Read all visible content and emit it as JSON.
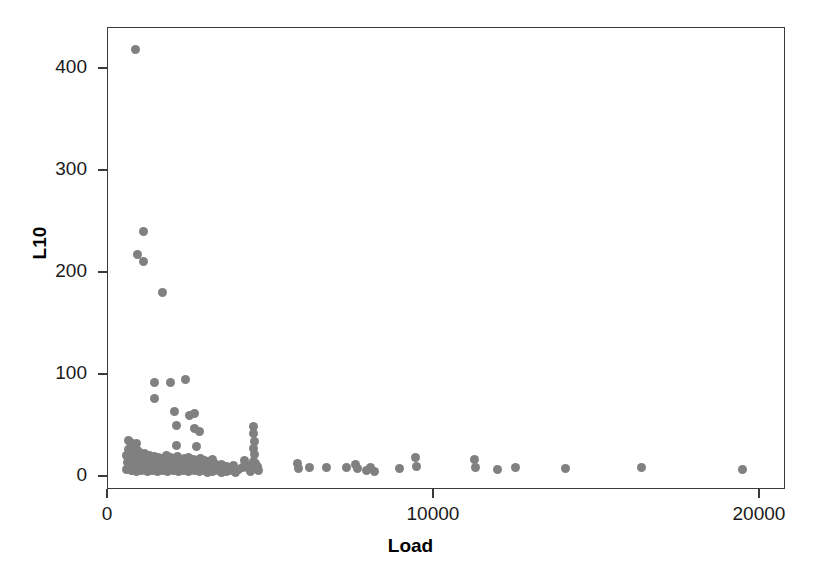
{
  "chart_data": {
    "type": "scatter",
    "title": "",
    "xlabel": "Load",
    "ylabel": "L10",
    "xlim": [
      0,
      20800
    ],
    "ylim": [
      -13,
      440
    ],
    "xticks": [
      0,
      10000,
      20000
    ],
    "xticklabels": [
      "0",
      "10000",
      "20000"
    ],
    "yticks": [
      0,
      100,
      200,
      300,
      400
    ],
    "yticklabels": [
      "0",
      "100",
      "200",
      "300",
      "400"
    ],
    "grid": false,
    "legend": null,
    "marker": {
      "shape": "circle",
      "color": "#808080",
      "size_px": 9
    },
    "frame_color": "#3a3a3a",
    "background": "#ffffff",
    "series": [
      {
        "name": "L10 vs Load",
        "color": "#808080",
        "points": [
          [
            850,
            419
          ],
          [
            1100,
            240
          ],
          [
            910,
            218
          ],
          [
            1100,
            211
          ],
          [
            1670,
            181
          ],
          [
            1430,
            92
          ],
          [
            1920,
            92
          ],
          [
            2370,
            95
          ],
          [
            1430,
            77
          ],
          [
            2030,
            64
          ],
          [
            2490,
            60
          ],
          [
            2640,
            62
          ],
          [
            2090,
            50
          ],
          [
            2640,
            47
          ],
          [
            2820,
            44
          ],
          [
            2090,
            31
          ],
          [
            2700,
            30
          ],
          [
            630,
            36
          ],
          [
            700,
            34
          ],
          [
            880,
            33
          ],
          [
            780,
            28
          ],
          [
            640,
            27
          ],
          [
            700,
            25
          ],
          [
            900,
            26
          ],
          [
            760,
            22
          ],
          [
            560,
            21
          ],
          [
            620,
            19
          ],
          [
            880,
            20
          ],
          [
            980,
            24
          ],
          [
            1040,
            22
          ],
          [
            1130,
            23
          ],
          [
            1210,
            19
          ],
          [
            1280,
            21
          ],
          [
            1350,
            18
          ],
          [
            1420,
            20
          ],
          [
            1490,
            17
          ],
          [
            1560,
            19
          ],
          [
            1630,
            16
          ],
          [
            1700,
            18
          ],
          [
            1780,
            21
          ],
          [
            1850,
            17
          ],
          [
            1920,
            19
          ],
          [
            1990,
            16
          ],
          [
            2060,
            18
          ],
          [
            2130,
            20
          ],
          [
            2200,
            17
          ],
          [
            2270,
            15
          ],
          [
            2340,
            18
          ],
          [
            2410,
            16
          ],
          [
            2480,
            19
          ],
          [
            2550,
            15
          ],
          [
            2620,
            17
          ],
          [
            2690,
            14
          ],
          [
            2760,
            16
          ],
          [
            2830,
            18
          ],
          [
            2900,
            14
          ],
          [
            2970,
            16
          ],
          [
            3050,
            13
          ],
          [
            3120,
            15
          ],
          [
            3200,
            17
          ],
          [
            3280,
            13
          ],
          [
            600,
            14
          ],
          [
            670,
            12
          ],
          [
            740,
            15
          ],
          [
            810,
            11
          ],
          [
            880,
            13
          ],
          [
            950,
            10
          ],
          [
            1020,
            14
          ],
          [
            1090,
            11
          ],
          [
            1160,
            13
          ],
          [
            1230,
            9
          ],
          [
            1300,
            12
          ],
          [
            1370,
            14
          ],
          [
            1440,
            10
          ],
          [
            1510,
            12
          ],
          [
            1580,
            9
          ],
          [
            1650,
            13
          ],
          [
            1720,
            11
          ],
          [
            1790,
            8
          ],
          [
            1860,
            12
          ],
          [
            1930,
            10
          ],
          [
            2000,
            13
          ],
          [
            2070,
            9
          ],
          [
            2140,
            11
          ],
          [
            2210,
            8
          ],
          [
            2280,
            12
          ],
          [
            2350,
            10
          ],
          [
            2420,
            7
          ],
          [
            2490,
            11
          ],
          [
            2560,
            9
          ],
          [
            2630,
            12
          ],
          [
            2700,
            8
          ],
          [
            2770,
            10
          ],
          [
            2840,
            7
          ],
          [
            2910,
            11
          ],
          [
            2980,
            9
          ],
          [
            3050,
            6
          ],
          [
            3120,
            10
          ],
          [
            3190,
            8
          ],
          [
            3260,
            11
          ],
          [
            3340,
            7
          ],
          [
            3410,
            9
          ],
          [
            3480,
            12
          ],
          [
            3550,
            8
          ],
          [
            3630,
            10
          ],
          [
            3700,
            6
          ],
          [
            3780,
            9
          ],
          [
            3860,
            11
          ],
          [
            580,
            7
          ],
          [
            650,
            9
          ],
          [
            720,
            6
          ],
          [
            800,
            8
          ],
          [
            880,
            5
          ],
          [
            960,
            8
          ],
          [
            1040,
            6
          ],
          [
            1120,
            9
          ],
          [
            1200,
            5
          ],
          [
            1280,
            7
          ],
          [
            1360,
            6
          ],
          [
            1440,
            8
          ],
          [
            1520,
            5
          ],
          [
            1600,
            7
          ],
          [
            1680,
            6
          ],
          [
            1760,
            9
          ],
          [
            1840,
            5
          ],
          [
            1920,
            7
          ],
          [
            2000,
            6
          ],
          [
            2080,
            8
          ],
          [
            2160,
            5
          ],
          [
            2240,
            7
          ],
          [
            2320,
            6
          ],
          [
            2400,
            9
          ],
          [
            2480,
            5
          ],
          [
            2560,
            7
          ],
          [
            2640,
            6
          ],
          [
            2720,
            8
          ],
          [
            2800,
            5
          ],
          [
            2880,
            7
          ],
          [
            2960,
            6
          ],
          [
            3040,
            4
          ],
          [
            3120,
            7
          ],
          [
            3200,
            5
          ],
          [
            3290,
            8
          ],
          [
            3380,
            6
          ],
          [
            3470,
            4
          ],
          [
            3560,
            7
          ],
          [
            3650,
            5
          ],
          [
            3740,
            8
          ],
          [
            3830,
            6
          ],
          [
            3920,
            4
          ],
          [
            4010,
            7
          ],
          [
            4120,
            9
          ],
          [
            4240,
            11
          ],
          [
            4380,
            8
          ],
          [
            4460,
            49
          ],
          [
            4470,
            42
          ],
          [
            4480,
            35
          ],
          [
            4460,
            28
          ],
          [
            4490,
            22
          ],
          [
            4470,
            15
          ],
          [
            4440,
            8
          ],
          [
            4360,
            5
          ],
          [
            4290,
            9
          ],
          [
            4180,
            16
          ],
          [
            4580,
            10
          ],
          [
            4610,
            6
          ],
          [
            4540,
            13
          ],
          [
            5800,
            13
          ],
          [
            5830,
            8
          ],
          [
            6190,
            9
          ],
          [
            6690,
            9
          ],
          [
            7320,
            9
          ],
          [
            7590,
            12
          ],
          [
            7660,
            8
          ],
          [
            7940,
            6
          ],
          [
            8060,
            9
          ],
          [
            8170,
            5
          ],
          [
            8950,
            8
          ],
          [
            9440,
            19
          ],
          [
            9450,
            10
          ],
          [
            11250,
            17
          ],
          [
            11280,
            9
          ],
          [
            11960,
            7
          ],
          [
            12510,
            9
          ],
          [
            14050,
            8
          ],
          [
            16380,
            9
          ],
          [
            19480,
            7
          ]
        ]
      }
    ]
  },
  "axes": {
    "x_title": "Load",
    "y_title": "L10"
  }
}
